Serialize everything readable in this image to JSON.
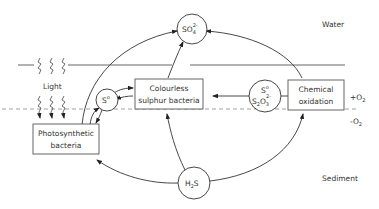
{
  "diagram": {
    "zones": {
      "water": "Water",
      "sediment": "Sediment",
      "oxic": "+O",
      "oxic_sub": "2",
      "anoxic": "-O",
      "anoxic_sub": "2",
      "light": "Light"
    },
    "nodes": {
      "sulphate": {
        "main": "SO",
        "sub": "4",
        "sup": "2-"
      },
      "hydrogen_sulphide": {
        "main": "H",
        "sub": "2",
        "tail": "S"
      },
      "elemental_sulphur": {
        "main": "S",
        "sup": "o"
      },
      "sulphur_thiosulphate": {
        "line1": "S",
        "line1_sup": "o",
        "line2a": "S",
        "line2_sub1": "2",
        "line2b": "O",
        "line2_sub2": "3",
        "line2_sup": "2-"
      },
      "photosynthetic_bacteria": {
        "line1": "Photosynthetic",
        "line2": "bacteria"
      },
      "colourless_sulphur_bacteria": {
        "line1": "Colourless",
        "line2": "sulphur bacteria"
      },
      "chemical_oxidation": {
        "line1": "Chemical",
        "line2": "oxidation"
      }
    },
    "edges": [
      {
        "from": "photosynthetic_bacteria",
        "to": "sulphate"
      },
      {
        "from": "photosynthetic_bacteria",
        "to": "elemental_sulphur"
      },
      {
        "from": "elemental_sulphur",
        "to": "photosynthetic_bacteria"
      },
      {
        "from": "elemental_sulphur",
        "to": "colourless_sulphur_bacteria"
      },
      {
        "from": "colourless_sulphur_bacteria",
        "to": "elemental_sulphur"
      },
      {
        "from": "colourless_sulphur_bacteria",
        "to": "sulphate"
      },
      {
        "from": "sulphur_thiosulphate",
        "to": "colourless_sulphur_bacteria"
      },
      {
        "from": "chemical_oxidation",
        "to": "sulphur_thiosulphate"
      },
      {
        "from": "chemical_oxidation",
        "to": "sulphate"
      },
      {
        "from": "hydrogen_sulphide",
        "to": "photosynthetic_bacteria"
      },
      {
        "from": "hydrogen_sulphide",
        "to": "colourless_sulphur_bacteria"
      },
      {
        "from": "hydrogen_sulphide",
        "to": "chemical_oxidation"
      }
    ]
  }
}
